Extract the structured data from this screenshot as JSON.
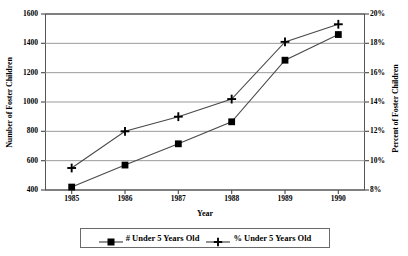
{
  "chart_data": {
    "type": "line",
    "title": "",
    "xlabel": "Year",
    "ylabel": "Number of Foster Children",
    "y2label": "Percent of Foster Children",
    "categories": [
      "1985",
      "1986",
      "1987",
      "1988",
      "1989",
      "1990"
    ],
    "x": [
      1985,
      1986,
      1987,
      1988,
      1989,
      1990
    ],
    "grid": true,
    "legend_position": "bottom",
    "ylim": [
      400,
      1600
    ],
    "ytick_step": 200,
    "yticks": [
      400,
      600,
      800,
      1000,
      1200,
      1400,
      1600
    ],
    "ytick_labels": [
      "400",
      "600",
      "800",
      "1000",
      "1200",
      "1400",
      "1600"
    ],
    "y2lim": [
      8,
      20
    ],
    "y2tick_step": 2,
    "y2ticks": [
      8,
      10,
      12,
      14,
      16,
      18,
      20
    ],
    "y2tick_labels": [
      "8%",
      "10%",
      "12%",
      "14%",
      "16%",
      "18%",
      "20%"
    ],
    "xtick_labels": [
      "1985",
      "1986",
      "1987",
      "1988",
      "1989",
      "1990"
    ],
    "series": [
      {
        "name": "# Under 5 Years Old",
        "axis": "left",
        "marker": "square",
        "color": "#000000",
        "values": [
          420,
          570,
          715,
          865,
          1285,
          1460
        ]
      },
      {
        "name": "% Under 5 Years Old",
        "axis": "right",
        "marker": "plus",
        "color": "#000000",
        "values": [
          9.5,
          12.0,
          13.0,
          14.2,
          18.1,
          19.3
        ]
      }
    ]
  },
  "legend": {
    "entries": [
      {
        "label": "# Under 5 Years Old",
        "marker": "square"
      },
      {
        "label": "% Under 5 Years Old",
        "marker": "plus"
      }
    ]
  },
  "axes": {
    "left_title": "Number of Foster Children",
    "right_title": "Percent of Foster Children",
    "x_title": "Year"
  },
  "colors": {
    "line": "#4a4a4a",
    "marker": "#000000",
    "grid": "#8f8f8f",
    "frame": "#555555",
    "background": "#ffffff"
  }
}
